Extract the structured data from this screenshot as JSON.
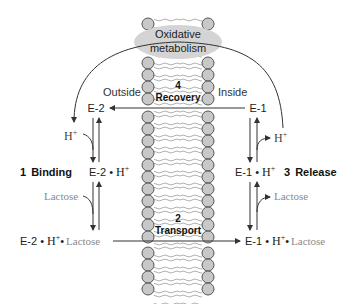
{
  "membrane": {
    "outside_label": "Outside",
    "inside_label": "Inside",
    "colors": {
      "head": "#c8c8c8",
      "head_stroke": "#555555",
      "tail": "#a0a0a0"
    }
  },
  "energy_source": {
    "line1": "Oxidative",
    "line2": "metabolism",
    "color": "#d4d4d4"
  },
  "steps": [
    {
      "number": "1",
      "label": "Binding"
    },
    {
      "number": "2",
      "label": "Transport"
    },
    {
      "number": "3",
      "label": "Release"
    },
    {
      "number": "4",
      "label": "Recovery"
    }
  ],
  "states": {
    "e2": "E-2",
    "e2_h": {
      "enzyme": "E-2",
      "dot": "•",
      "proton": "H",
      "charge": "+"
    },
    "e2_h_lactose": {
      "enzyme": "E-2",
      "dot": "•",
      "proton": "H",
      "charge": "+",
      "dot2": "•",
      "substrate": "Lactose"
    },
    "e1": "E-1",
    "e1_h": {
      "enzyme": "E-1",
      "dot": "•",
      "proton": "H",
      "charge": "+"
    },
    "e1_h_lactose": {
      "enzyme": "E-1",
      "dot": "•",
      "proton": "H",
      "charge": "+",
      "dot2": "•",
      "substrate": "Lactose"
    }
  },
  "species": {
    "proton_outside": {
      "base": "H",
      "charge": "+"
    },
    "proton_inside": {
      "base": "H",
      "charge": "+"
    },
    "lactose_outside": "Lactose",
    "lactose_inside": "Lactose"
  },
  "colors": {
    "text": "#1a1a1a",
    "substrate_text": "#8a8a8a",
    "arrow": "#333333"
  }
}
